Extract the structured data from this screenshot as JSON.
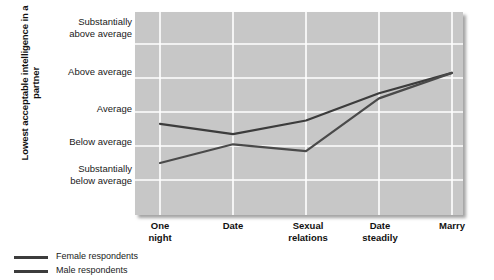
{
  "chart_data": {
    "type": "line",
    "title": "",
    "xlabel": "",
    "ylabel": "Lowest acceptable intelligence in a partner",
    "categories": [
      "One night",
      "Date",
      "Sexual relations",
      "Date steadily",
      "Marry"
    ],
    "category_lines": [
      [
        "One",
        "night"
      ],
      [
        "Date",
        ""
      ],
      [
        "Sexual",
        "relations"
      ],
      [
        "Date",
        "steadily"
      ],
      [
        "Marry",
        ""
      ]
    ],
    "ytick_labels": [
      "Substantially above average",
      "Above average",
      "Average",
      "Below average",
      "Substantially below average"
    ],
    "ytick_lines": [
      [
        "Substantially",
        "above average"
      ],
      [
        "Above average",
        ""
      ],
      [
        "Average",
        ""
      ],
      [
        "Below average",
        ""
      ],
      [
        "Substantially",
        "below average"
      ]
    ],
    "ylim": [
      1,
      5
    ],
    "yscale_note": "Ordinal scale: 1 = Substantially below average, 5 = Substantially above average",
    "grid": true,
    "legend_position": "below-left",
    "series": [
      {
        "name": "Female respondents",
        "color": "#3c3c3c",
        "values": [
          2.65,
          2.35,
          2.75,
          3.55,
          4.15
        ]
      },
      {
        "name": "Male respondents",
        "color": "#4a4a4a",
        "values": [
          1.5,
          2.05,
          1.85,
          3.4,
          4.15
        ]
      }
    ],
    "colors": {
      "panel_background": "#c7c7c7",
      "gridline": "#ffffff",
      "page_background": "#ffffff",
      "text": "#1a1a1a"
    }
  }
}
